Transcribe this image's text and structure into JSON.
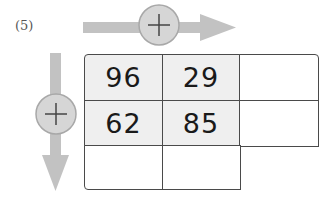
{
  "problem_label": "(5)",
  "operation_icons": {
    "horizontal": "plus-icon",
    "vertical": "plus-icon"
  },
  "colors": {
    "arrow": "#c2c2c2",
    "circle_fill": "#d6d6d6",
    "circle_stroke": "#a8a8a8",
    "filled_cell": "#efefef",
    "grid_line": "#4a4a4a"
  },
  "grid": {
    "rows": [
      [
        "96",
        "29",
        ""
      ],
      [
        "62",
        "85",
        ""
      ],
      [
        "",
        ""
      ]
    ]
  }
}
